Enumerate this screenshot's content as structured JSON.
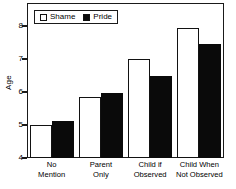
{
  "chart_data": {
    "type": "bar",
    "title": "",
    "xlabel": "",
    "ylabel": "Age",
    "ylim": [
      4,
      8.7
    ],
    "yticks": [
      4,
      5,
      6,
      7,
      8
    ],
    "ytick_labels": [
      "4",
      "5",
      "6",
      "7",
      "8"
    ],
    "grid": false,
    "legend_position": "top-left",
    "categories": [
      "No Mention",
      "Parent Only",
      "Child if Observed",
      "Child When Not Observed"
    ],
    "category_lines": [
      [
        "No",
        "Mention"
      ],
      [
        "Parent",
        "Only"
      ],
      [
        "Child if",
        "Observed"
      ],
      [
        "Child When",
        "Not Observed"
      ]
    ],
    "series": [
      {
        "name": "Shame",
        "color": "#ffffff",
        "edge_color": "#121212",
        "values": [
          5.0,
          5.85,
          7.0,
          7.93
        ]
      },
      {
        "name": "Pride",
        "color": "#0a0a0a",
        "edge_color": "#0a0a0a",
        "values": [
          5.13,
          5.98,
          6.5,
          7.45
        ]
      }
    ]
  },
  "legend": {
    "items": [
      {
        "label": "Shame",
        "swatch": "open-square"
      },
      {
        "label": "Pride",
        "swatch": "filled-square"
      }
    ]
  },
  "axes": {
    "y_title": "Age"
  }
}
